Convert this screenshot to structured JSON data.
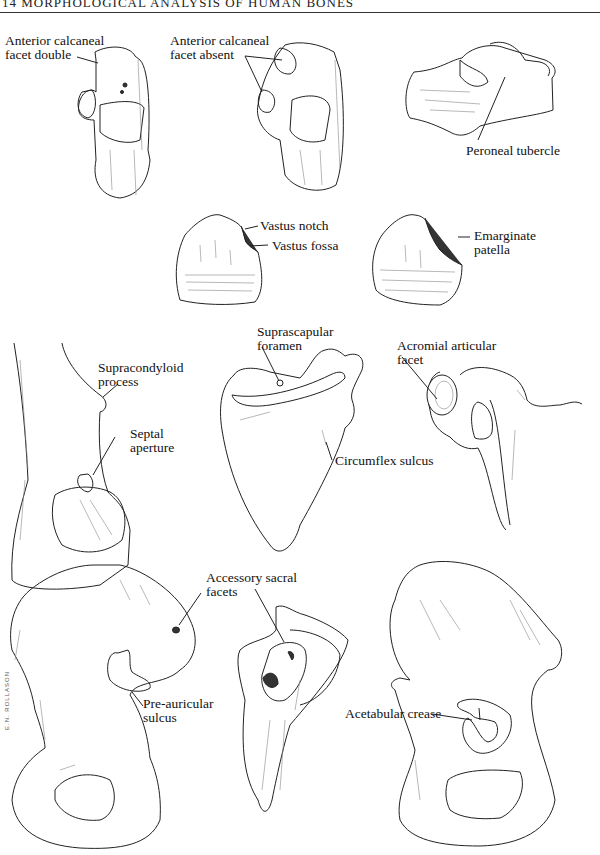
{
  "page": {
    "header": "14  MORPHOLOGICAL ANALYSIS OF HUMAN BONES",
    "signature": "E.N. ROLLASON"
  },
  "figures": {
    "talus_1": {
      "label": "Anterior calcaneal\nfacet double",
      "line1": "Anterior calcaneal",
      "line2": "facet double"
    },
    "talus_2": {
      "line1": "Anterior calcaneal",
      "line2": "facet absent"
    },
    "calcaneus": {
      "line1": "Peroneal tubercle"
    },
    "patella_1": {
      "notch": "Vastus notch",
      "fossa": "Vastus fossa"
    },
    "patella_2": {
      "line1": "Emarginate",
      "line2": "patella"
    },
    "humerus": {
      "process_line1": "Supracondyloid",
      "process_line2": "process",
      "aperture_line1": "Septal",
      "aperture_line2": "aperture"
    },
    "scapula_posterior": {
      "foramen_line1": "Suprascapular",
      "foramen_line2": "foramen",
      "sulcus": "Circumflex sulcus"
    },
    "scapula_lateral": {
      "line1": "Acromial articular",
      "line2": "facet"
    },
    "ilium": {
      "facets_line1": "Accessory sacral",
      "facets_line2": "facets",
      "sulcus_line1": "Pre-auricular",
      "sulcus_line2": "sulcus"
    },
    "sacrum": {},
    "os_coxae": {
      "line1": "Acetabular crease"
    }
  }
}
